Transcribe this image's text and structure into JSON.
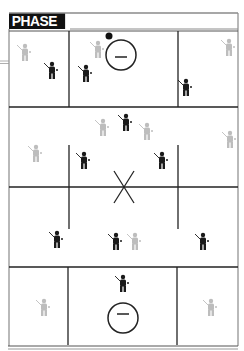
{
  "diagram": {
    "title": "PHASE 1",
    "colors": {
      "line": "#222222",
      "frame": "#8a8a8a",
      "title_bg": "#111111",
      "title_text": "#ffffff",
      "offense_player": "#1a1a1a",
      "defense_player": "#a8a8a8",
      "ball": "#111111"
    },
    "goals": [
      {
        "name": "top-goal",
        "cx": 121,
        "cy": 55,
        "r": 15
      },
      {
        "name": "bottom-goal",
        "cx": 123,
        "cy": 318,
        "r": 15
      }
    ],
    "center_mark": {
      "symbol": "X",
      "cx": 124,
      "cy": 187
    },
    "ball": {
      "cx": 109,
      "cy": 36,
      "r": 3.5
    },
    "players": [
      {
        "team": "defense",
        "x": 25,
        "y": 55
      },
      {
        "team": "offense",
        "x": 52,
        "y": 73
      },
      {
        "team": "offense",
        "x": 86,
        "y": 76
      },
      {
        "team": "defense",
        "x": 98,
        "y": 52
      },
      {
        "team": "offense",
        "x": 186,
        "y": 90
      },
      {
        "team": "defense",
        "x": 229,
        "y": 50
      },
      {
        "team": "defense",
        "x": 103,
        "y": 130
      },
      {
        "team": "offense",
        "x": 126,
        "y": 125
      },
      {
        "team": "defense",
        "x": 147,
        "y": 134
      },
      {
        "team": "defense",
        "x": 36,
        "y": 156
      },
      {
        "team": "offense",
        "x": 84,
        "y": 163
      },
      {
        "team": "offense",
        "x": 162,
        "y": 163
      },
      {
        "team": "defense",
        "x": 230,
        "y": 142
      },
      {
        "team": "offense",
        "x": 57,
        "y": 242
      },
      {
        "team": "offense",
        "x": 116,
        "y": 244
      },
      {
        "team": "defense",
        "x": 135,
        "y": 244
      },
      {
        "team": "offense",
        "x": 203,
        "y": 244
      },
      {
        "team": "offense",
        "x": 123,
        "y": 286
      },
      {
        "team": "defense",
        "x": 44,
        "y": 310
      },
      {
        "team": "defense",
        "x": 211,
        "y": 310
      }
    ]
  }
}
